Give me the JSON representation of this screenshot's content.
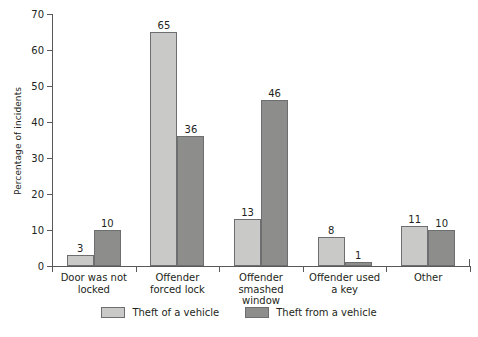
{
  "chart_data": {
    "type": "bar",
    "title": "",
    "xlabel": "",
    "ylabel": "Percentage of incidents",
    "ylim": [
      0,
      70
    ],
    "yticks": [
      0,
      10,
      20,
      30,
      40,
      50,
      60,
      70
    ],
    "grid": false,
    "legend_position": "bottom",
    "categories": [
      "Door was not locked",
      "Offender forced lock",
      "Offender smashed window",
      "Offender used a key",
      "Other"
    ],
    "category_lines": [
      [
        "Door was not",
        "locked"
      ],
      [
        "Offender",
        "forced lock"
      ],
      [
        "Offender",
        "smashed",
        "window"
      ],
      [
        "Offender used",
        "a key"
      ],
      [
        "Other"
      ]
    ],
    "series": [
      {
        "name": "Theft of a vehicle",
        "color": "#c9cac8",
        "values": [
          3,
          65,
          13,
          8,
          11
        ]
      },
      {
        "name": "Theft from a vehicle",
        "color": "#8d8e8c",
        "values": [
          10,
          36,
          46,
          1,
          10
        ]
      }
    ]
  },
  "legend": {
    "items": [
      {
        "label": "Theft of a vehicle",
        "swatch": "a"
      },
      {
        "label": "Theft from a vehicle",
        "swatch": "b"
      }
    ]
  },
  "colors": {
    "series_a": "#c9cac8",
    "series_b": "#8d8e8c",
    "axis": "#58595b",
    "text": "#231f20",
    "background": "#ffffff"
  }
}
